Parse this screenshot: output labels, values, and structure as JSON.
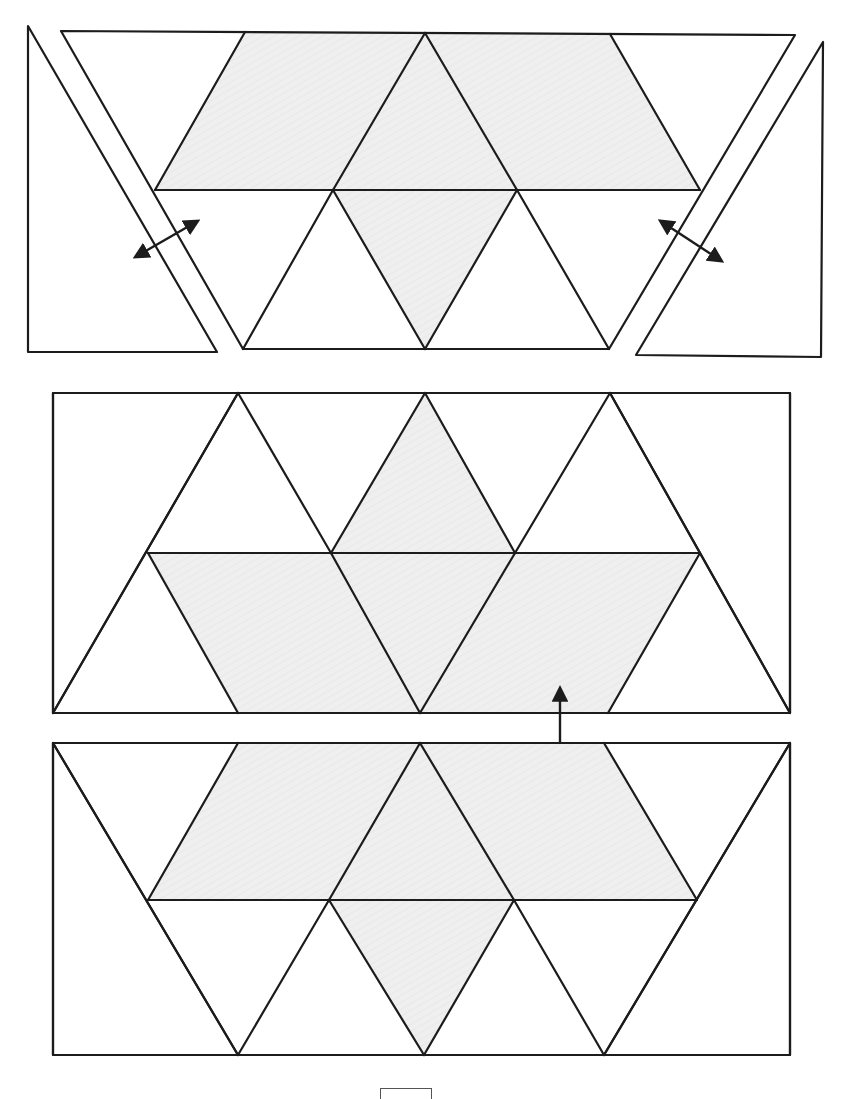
{
  "figure": {
    "colors": {
      "line": "#1c1c1c",
      "shade": "#ededed",
      "dot": "#222222",
      "background": "#ffffff"
    },
    "page_box": {
      "x": 380,
      "y": 1088,
      "w": 50,
      "h": 10
    }
  },
  "panels": [
    {
      "id": "step-1-top",
      "trapezoid": [
        [
          61,
          31
        ],
        [
          795,
          35
        ],
        [
          609,
          349
        ],
        [
          243,
          349
        ]
      ],
      "shaded": [
        [
          [
            245,
            32
          ],
          [
            425,
            33
          ],
          [
            333,
            190
          ],
          [
            155,
            190
          ]
        ],
        [
          [
            425,
            33
          ],
          [
            517,
            190
          ],
          [
            425,
            349
          ],
          [
            333,
            190
          ]
        ],
        [
          [
            425,
            33
          ],
          [
            610,
            34
          ],
          [
            700,
            190
          ],
          [
            517,
            190
          ]
        ]
      ],
      "lines": [
        [
          [
            155,
            190
          ],
          [
            700,
            190
          ]
        ],
        [
          [
            245,
            32
          ],
          [
            155,
            190
          ]
        ],
        [
          [
            425,
            33
          ],
          [
            333,
            190
          ]
        ],
        [
          [
            425,
            33
          ],
          [
            517,
            190
          ]
        ],
        [
          [
            610,
            34
          ],
          [
            700,
            190
          ]
        ],
        [
          [
            333,
            190
          ],
          [
            243,
            349
          ]
        ],
        [
          [
            333,
            190
          ],
          [
            425,
            349
          ]
        ],
        [
          [
            517,
            190
          ],
          [
            425,
            349
          ]
        ],
        [
          [
            517,
            190
          ],
          [
            609,
            349
          ]
        ]
      ],
      "dotted": [
        [
          [
            28,
            26
          ],
          [
            217,
            352
          ],
          [
            28,
            352
          ]
        ],
        [
          [
            823,
            42
          ],
          [
            821,
            357
          ],
          [
            636,
            355
          ]
        ]
      ],
      "arrows": [
        {
          "from": [
            137,
            256
          ],
          "to": [
            196,
            222
          ]
        },
        {
          "from": [
            662,
            222
          ],
          "to": [
            720,
            260
          ]
        }
      ]
    },
    {
      "id": "step-2-middle",
      "rect": [
        [
          53,
          393
        ],
        [
          790,
          393
        ],
        [
          790,
          713
        ],
        [
          53,
          713
        ]
      ],
      "shaded": [
        [
          [
            148,
            553
          ],
          [
            331,
            553
          ],
          [
            420,
            713
          ],
          [
            238,
            713
          ]
        ],
        [
          [
            425,
            393
          ],
          [
            515,
            553
          ],
          [
            420,
            713
          ],
          [
            331,
            553
          ]
        ],
        [
          [
            515,
            553
          ],
          [
            700,
            553
          ],
          [
            608,
            713
          ],
          [
            420,
            713
          ]
        ]
      ],
      "lines": [
        [
          [
            148,
            553
          ],
          [
            700,
            553
          ]
        ],
        [
          [
            238,
            393
          ],
          [
            53,
            713
          ]
        ],
        [
          [
            238,
            393
          ],
          [
            331,
            553
          ]
        ],
        [
          [
            425,
            393
          ],
          [
            331,
            553
          ]
        ],
        [
          [
            425,
            393
          ],
          [
            515,
            553
          ]
        ],
        [
          [
            610,
            393
          ],
          [
            515,
            553
          ]
        ],
        [
          [
            610,
            393
          ],
          [
            790,
            713
          ]
        ],
        [
          [
            148,
            553
          ],
          [
            238,
            713
          ]
        ],
        [
          [
            331,
            553
          ],
          [
            420,
            713
          ]
        ],
        [
          [
            515,
            553
          ],
          [
            420,
            713
          ]
        ],
        [
          [
            700,
            553
          ],
          [
            608,
            713
          ]
        ]
      ],
      "dotted": [
        [
          [
            53,
            393
          ],
          [
            238,
            393
          ],
          [
            53,
            713
          ]
        ],
        [
          [
            610,
            393
          ],
          [
            790,
            393
          ],
          [
            790,
            713
          ]
        ]
      ],
      "arrows": [
        {
          "from": [
            560,
            690
          ],
          "to": [
            560,
            768
          ]
        }
      ]
    },
    {
      "id": "step-3-bottom",
      "rect": [
        [
          53,
          743
        ],
        [
          790,
          743
        ],
        [
          790,
          1055
        ],
        [
          53,
          1055
        ]
      ],
      "shaded": [
        [
          [
            238,
            743
          ],
          [
            420,
            743
          ],
          [
            329,
            900
          ],
          [
            148,
            900
          ]
        ],
        [
          [
            420,
            743
          ],
          [
            514,
            900
          ],
          [
            424,
            1055
          ],
          [
            329,
            900
          ]
        ],
        [
          [
            420,
            743
          ],
          [
            604,
            743
          ],
          [
            697,
            900
          ],
          [
            514,
            900
          ]
        ]
      ],
      "lines": [
        [
          [
            148,
            900
          ],
          [
            697,
            900
          ]
        ],
        [
          [
            53,
            743
          ],
          [
            238,
            1055
          ]
        ],
        [
          [
            238,
            743
          ],
          [
            148,
            900
          ]
        ],
        [
          [
            420,
            743
          ],
          [
            329,
            900
          ]
        ],
        [
          [
            420,
            743
          ],
          [
            514,
            900
          ]
        ],
        [
          [
            604,
            743
          ],
          [
            697,
            900
          ]
        ],
        [
          [
            790,
            743
          ],
          [
            604,
            1055
          ]
        ],
        [
          [
            329,
            900
          ],
          [
            238,
            1055
          ]
        ],
        [
          [
            329,
            900
          ],
          [
            424,
            1055
          ]
        ],
        [
          [
            514,
            900
          ],
          [
            424,
            1055
          ]
        ],
        [
          [
            514,
            900
          ],
          [
            604,
            1055
          ]
        ]
      ],
      "dotted": [
        [
          [
            53,
            743
          ],
          [
            238,
            1055
          ],
          [
            53,
            1055
          ]
        ],
        [
          [
            790,
            743
          ],
          [
            790,
            1055
          ],
          [
            604,
            1055
          ]
        ]
      ],
      "arrows": []
    }
  ]
}
